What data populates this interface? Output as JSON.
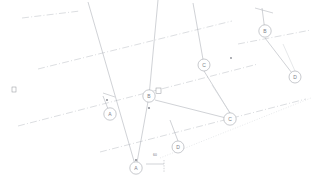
{
  "drawing": {
    "title": "Structural Grid Plan",
    "background_color": "#ffffff",
    "line_color": "#a9acb3",
    "centerline_color": "#b9bcc2",
    "bubble_stroke_color": "#9b9ea5",
    "text_color": "#7e8189",
    "width": 311,
    "height": 186
  },
  "grid_bubbles": [
    {
      "label": "B",
      "cx": 265,
      "cy": 31,
      "r": 6.2
    },
    {
      "label": "D",
      "cx": 295,
      "cy": 77,
      "r": 6.0
    },
    {
      "label": "C",
      "cx": 204,
      "cy": 65,
      "r": 6.0
    },
    {
      "label": "B",
      "cx": 149,
      "cy": 96,
      "r": 6.2
    },
    {
      "label": "A",
      "cx": 110,
      "cy": 114,
      "r": 6.2
    },
    {
      "label": "C",
      "cx": 230,
      "cy": 119,
      "r": 6.2
    },
    {
      "label": "D",
      "cx": 178,
      "cy": 147,
      "r": 6.0
    },
    {
      "label": "A",
      "cx": 136,
      "cy": 168,
      "r": 6.2
    }
  ],
  "centerlines": [
    {
      "name": "centerline-upper-left",
      "x1": 22,
      "y1": 18,
      "x2": 80,
      "y2": 11
    },
    {
      "name": "centerline-1",
      "x1": 38,
      "y1": 69,
      "x2": 232,
      "y2": 21
    },
    {
      "name": "centerline-2",
      "x1": 18,
      "y1": 126,
      "x2": 258,
      "y2": 64
    },
    {
      "name": "centerline-3",
      "x1": 100,
      "y1": 152,
      "x2": 306,
      "y2": 99
    },
    {
      "name": "centerline-right-top",
      "x1": 238,
      "y1": 44,
      "x2": 311,
      "y2": 30
    }
  ],
  "member_lines": [
    {
      "name": "member-grid-line-a",
      "x1": 88,
      "y1": 2,
      "x2": 136,
      "y2": 168
    },
    {
      "name": "member-grid-line-b",
      "x1": 158,
      "y1": 0,
      "x2": 149,
      "y2": 96
    },
    {
      "name": "member-grid-line-c",
      "x1": 193,
      "y1": 3,
      "x2": 204,
      "y2": 65
    },
    {
      "name": "member-grid-line-d",
      "x1": 262,
      "y1": 8,
      "x2": 265,
      "y2": 31
    },
    {
      "name": "member-b-to-node",
      "x1": 149,
      "y1": 96,
      "x2": 136,
      "y2": 168
    },
    {
      "name": "member-b-to-c",
      "x1": 155,
      "y1": 100,
      "x2": 230,
      "y2": 119
    },
    {
      "name": "member-c-to-d",
      "x1": 265,
      "y1": 38,
      "x2": 295,
      "y2": 77
    },
    {
      "name": "member-node-to-d",
      "x1": 204,
      "y1": 71,
      "x2": 230,
      "y2": 113
    },
    {
      "name": "member-lower-left",
      "x1": 110,
      "y1": 114,
      "x2": 103,
      "y2": 96
    },
    {
      "name": "member-d-lower",
      "x1": 178,
      "y1": 141,
      "x2": 170,
      "y2": 120
    }
  ],
  "faint_lines": [
    {
      "name": "faint-line-right",
      "x1": 283,
      "y1": 44,
      "x2": 295,
      "y2": 71
    },
    {
      "name": "faint-line-center",
      "x1": 212,
      "y1": 85,
      "x2": 230,
      "y2": 113
    }
  ],
  "dotted_lines": [
    {
      "name": "dotted-diagonal-lower",
      "x1": 160,
      "y1": 158,
      "x2": 311,
      "y2": 98
    }
  ],
  "node_dots": [
    {
      "name": "node-dot-center",
      "cx": 149,
      "cy": 108,
      "r": 1.1
    },
    {
      "name": "node-dot-lower",
      "cx": 136,
      "cy": 160,
      "r": 1.1
    },
    {
      "name": "node-dot-left",
      "cx": 107,
      "cy": 100,
      "r": 1.0
    },
    {
      "name": "node-dot-intersect-1",
      "cx": 231,
      "cy": 58,
      "r": 0.9
    }
  ],
  "column_markers": [
    {
      "name": "column-marker-center",
      "x": 156,
      "y": 88,
      "w": 5,
      "h": 5.5
    },
    {
      "name": "column-marker-left",
      "x": 12,
      "y": 87,
      "w": 4,
      "h": 5
    }
  ],
  "tick_marks": [
    {
      "name": "tick-top-right-1",
      "x1": 255,
      "y1": 8,
      "x2": 273,
      "y2": 13
    },
    {
      "name": "tick-mid-left-1",
      "x1": 103,
      "y1": 93,
      "x2": 115,
      "y2": 97
    }
  ],
  "dimension_annotation": {
    "name": "dimension-callout",
    "value": "60",
    "x": 155,
    "y": 155,
    "line_start_x": 146,
    "line_start_y": 164,
    "line_end_x": 164,
    "line_end_y": 164,
    "tick_top_y": 160,
    "tick_bottom_y": 172
  }
}
